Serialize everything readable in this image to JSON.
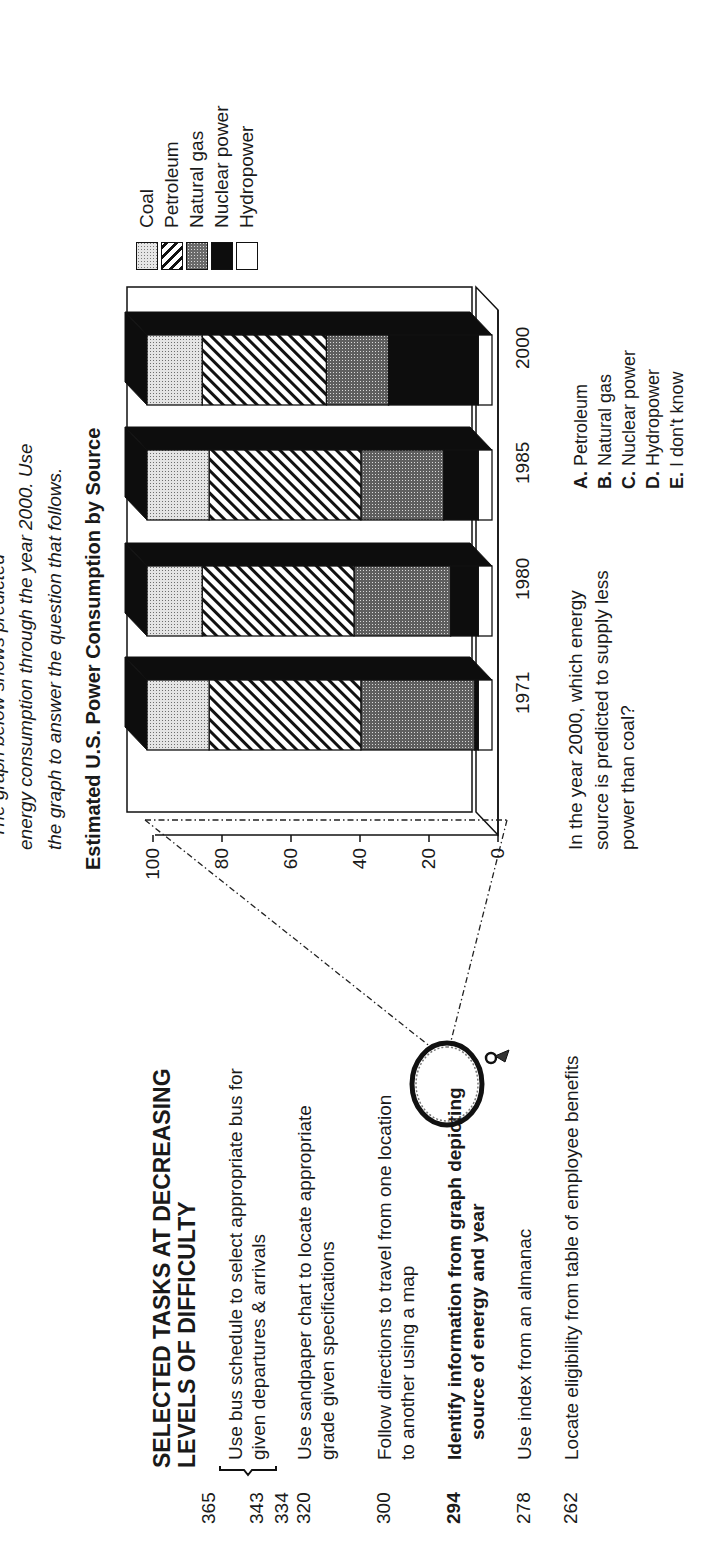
{
  "intro": {
    "line1": "The graph below shows predicted",
    "line2": "energy consumption through the year 2000. Use",
    "line3": "the graph to answer the question that follows."
  },
  "chart_title": "Estimated U.S. Power Consumption by Source",
  "legend": [
    {
      "label": "Coal",
      "pattern": "coal"
    },
    {
      "label": "Petroleum",
      "pattern": "petroleum"
    },
    {
      "label": "Natural gas",
      "pattern": "gas"
    },
    {
      "label": "Nuclear power",
      "pattern": "nuclear"
    },
    {
      "label": "Hydropower",
      "pattern": "hydro"
    }
  ],
  "y_ticks": [
    "100",
    "80",
    "60",
    "40",
    "20",
    "0"
  ],
  "x_ticks": [
    "1971",
    "1980",
    "1985",
    "2000"
  ],
  "question": {
    "line1": "In the year 2000, which energy",
    "line2": "source is predicted to supply less",
    "line3": "power than coal?"
  },
  "options": [
    {
      "letter": "A.",
      "text": "Petroleum"
    },
    {
      "letter": "B.",
      "text": "Natural gas"
    },
    {
      "letter": "C.",
      "text": "Nuclear power"
    },
    {
      "letter": "D.",
      "text": "Hydropower"
    },
    {
      "letter": "E.",
      "text": "I don't know"
    }
  ],
  "tasks": {
    "title_line1": "SELECTED TASKS AT DECREASING",
    "title_line2": "LEVELS OF DIFFICULTY",
    "scores": [
      "365",
      "343",
      "334",
      "320",
      "300",
      "294",
      "278",
      "262"
    ],
    "items": [
      {
        "line1": "Use bus schedule to select appropriate bus for",
        "line2": "given departures & arrivals"
      },
      {
        "line1": "Use sandpaper chart to locate appropriate",
        "line2": "grade given specifications"
      },
      {
        "line1": "Follow directions to travel from one location",
        "line2": "to another using a map"
      },
      {
        "line1": "Identify information from graph depicting",
        "line2": "source of energy and year"
      },
      {
        "line1": "Use index from an almanac",
        "line2": ""
      },
      {
        "line1": "Locate eligibility from table of employee benefits",
        "line2": ""
      }
    ]
  },
  "chart_data": {
    "type": "bar",
    "stacked": true,
    "three_d": true,
    "title": "Estimated U.S. Power Consumption by Source",
    "xlabel": "",
    "ylabel": "",
    "ylim": [
      0,
      100
    ],
    "yticks": [
      0,
      20,
      40,
      60,
      80,
      100
    ],
    "categories": [
      "1971",
      "1980",
      "1985",
      "2000"
    ],
    "series": [
      {
        "name": "Hydropower",
        "values": [
          4,
          4,
          4,
          4
        ]
      },
      {
        "name": "Nuclear power",
        "values": [
          1,
          8,
          10,
          26
        ]
      },
      {
        "name": "Natural gas",
        "values": [
          33,
          28,
          24,
          18
        ]
      },
      {
        "name": "Petroleum",
        "values": [
          44,
          44,
          44,
          36
        ]
      },
      {
        "name": "Coal",
        "values": [
          18,
          16,
          18,
          16
        ]
      }
    ],
    "legend_position": "right"
  }
}
